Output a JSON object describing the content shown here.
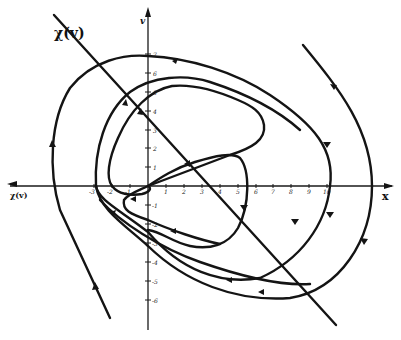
{
  "figure": {
    "line_label": "χ(v)",
    "x_axis_label": "x",
    "y_axis_label": "v",
    "neg_x_label": "χ(v)",
    "x_ticks": [
      "-3",
      "-2",
      "-1",
      "1",
      "2",
      "3",
      "4",
      "5",
      "6",
      "7",
      "8",
      "9",
      "10"
    ],
    "y_ticks_pos": [
      "1",
      "2",
      "3",
      "4",
      "5",
      "6",
      "7"
    ],
    "y_ticks_neg": [
      "-1",
      "-2",
      "-3",
      "-4",
      "-5",
      "-6"
    ],
    "colors": {
      "ink": "#141414",
      "background": "#ffffff"
    }
  }
}
